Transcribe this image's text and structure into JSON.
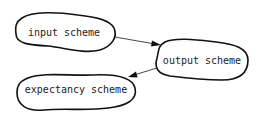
{
  "diagram": {
    "nodes": [
      {
        "id": "input",
        "label": "input scheme"
      },
      {
        "id": "output",
        "label": "output scheme"
      },
      {
        "id": "expectancy",
        "label": "expectancy scheme"
      }
    ],
    "edges": [
      {
        "from": "input",
        "to": "output"
      },
      {
        "from": "output",
        "to": "expectancy"
      }
    ]
  }
}
